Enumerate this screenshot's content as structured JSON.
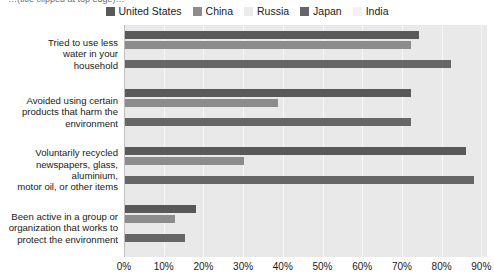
{
  "title": {
    "clipped_text": "…(title clipped at top edge)…"
  },
  "legend": {
    "position": "top-center",
    "entries": [
      {
        "label": "United States",
        "color": "#595959"
      },
      {
        "label": "China",
        "color": "#8c8c8c"
      },
      {
        "label": "Russia",
        "color": "#ebebeb"
      },
      {
        "label": "Japan",
        "color": "#666666"
      },
      {
        "label": "India",
        "color": "#f2f2f2"
      }
    ]
  },
  "axis": {
    "x_ticks": [
      "0%",
      "10%",
      "20%",
      "30%",
      "40%",
      "50%",
      "60%",
      "70%",
      "80%",
      "90%"
    ]
  },
  "chart_data": {
    "type": "bar",
    "orientation": "horizontal",
    "title": "",
    "xlabel": "",
    "ylabel": "",
    "xlim": [
      0,
      90
    ],
    "grid": true,
    "legend_position": "top-center",
    "categories": [
      "Tried to use less water in your household",
      "Avoided using certain products that harm the environment",
      "Voluntarily recycled newspapers, glass, aluminium, motor oil, or other items",
      "Been active in a group or organization that works to protect the environment"
    ],
    "category_lines": [
      [
        "Tried to use less",
        "water in your",
        "household"
      ],
      [
        "Avoided using certain",
        "products that harm the",
        "environment"
      ],
      [
        "Voluntarily recycled",
        "newspapers, glass,",
        "aluminium,",
        "motor oil, or other items"
      ],
      [
        "Been active in a group or",
        "organization that works to",
        "protect the environment"
      ]
    ],
    "series": [
      {
        "name": "United States",
        "color": "#595959",
        "values": [
          74,
          72,
          86,
          18
        ]
      },
      {
        "name": "China",
        "color": "#8c8c8c",
        "values": [
          72,
          38.5,
          30,
          12.5
        ]
      },
      {
        "name": "Russia",
        "color": "#ebebeb",
        "values": [
          0,
          0,
          0,
          0
        ]
      },
      {
        "name": "Japan",
        "color": "#666666",
        "values": [
          82,
          72,
          88,
          15
        ]
      },
      {
        "name": "India",
        "color": "#f2f2f2",
        "values": [
          0,
          0,
          0,
          0
        ]
      }
    ]
  }
}
